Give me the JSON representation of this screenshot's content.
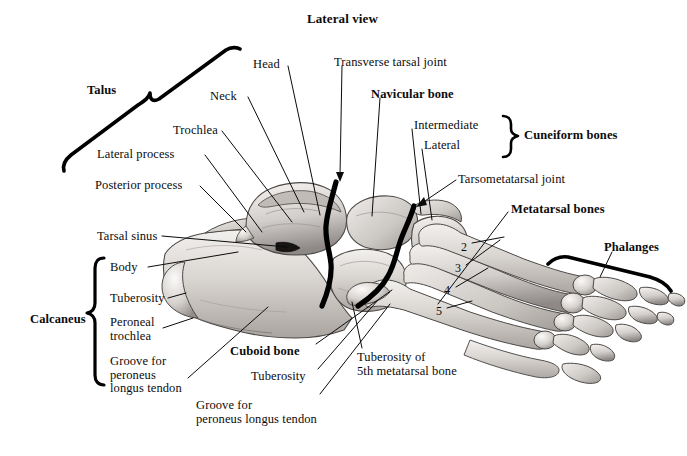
{
  "figure": {
    "title": "Lateral view",
    "background_color": "#ffffff",
    "ink_color": "#0b0b0b"
  },
  "group_labels": [
    {
      "id": "talus",
      "text": "Talus",
      "bold": true,
      "x": 87,
      "y": 84,
      "bracket": "diagonal-left"
    },
    {
      "id": "calcaneus",
      "text": "Calcaneus",
      "bold": true,
      "x": 30,
      "y": 313,
      "bracket": "vertical-left"
    },
    {
      "id": "cuneiform_bones",
      "text": "Cuneiform bones",
      "bold": true,
      "x": 524,
      "y": 132,
      "bracket": "vertical-right"
    },
    {
      "id": "metatarsal_bones",
      "text": "Metatarsal bones",
      "bold": true,
      "x": 511,
      "y": 204,
      "bracket": "none"
    },
    {
      "id": "phalanges",
      "text": "Phalanges",
      "bold": true,
      "x": 604,
      "y": 244,
      "bracket": "horizontal-bottom"
    },
    {
      "id": "navicular_bone",
      "text": "Navicular bone",
      "bold": true,
      "x": 371,
      "y": 90,
      "bracket": "none"
    },
    {
      "id": "cuboid_bone",
      "text": "Cuboid bone",
      "bold": true,
      "x": 230,
      "y": 348,
      "bracket": "none"
    }
  ],
  "part_labels": [
    {
      "id": "head",
      "text": "Head",
      "x": 253,
      "y": 59
    },
    {
      "id": "neck",
      "text": "Neck",
      "x": 210,
      "y": 92
    },
    {
      "id": "trochlea",
      "text": "Trochlea",
      "x": 173,
      "y": 127
    },
    {
      "id": "lateral_process",
      "text": "Lateral process",
      "x": 122,
      "y": 151
    },
    {
      "id": "posterior_process",
      "text": "Posterior process",
      "x": 95,
      "y": 182
    },
    {
      "id": "tarsal_sinus",
      "text": "Tarsal sinus",
      "x": 97,
      "y": 233
    },
    {
      "id": "calcaneus_body",
      "text": "Body",
      "x": 110,
      "y": 265
    },
    {
      "id": "calcaneus_tuberosity",
      "text": "Tuberosity",
      "x": 110,
      "y": 295
    },
    {
      "id": "peroneal_trochlea",
      "text": "Peroneal\ntrochlea",
      "x": 110,
      "y": 320
    },
    {
      "id": "groove_peroneus_calcaneus",
      "text": "Groove for\nperoneus\nlongus tendon",
      "x": 110,
      "y": 360
    },
    {
      "id": "transverse_tarsal_joint",
      "text": "Transverse tarsal joint",
      "x": 334,
      "y": 58
    },
    {
      "id": "cuneiform_intermediate",
      "text": "Intermediate",
      "x": 414,
      "y": 122
    },
    {
      "id": "cuneiform_lateral",
      "text": "Lateral",
      "x": 424,
      "y": 142
    },
    {
      "id": "tarsometatarsal_joint",
      "text": "Tarsometatarsal joint",
      "x": 458,
      "y": 176
    },
    {
      "id": "cuboid_tuberosity",
      "text": "Tuberosity",
      "x": 251,
      "y": 373
    },
    {
      "id": "groove_peroneus_cuboid",
      "text": "Groove for\nperoneus longus tendon",
      "x": 196,
      "y": 403
    },
    {
      "id": "tuberosity_5th_metatarsal",
      "text": "Tuberosity of\n5th metatarsal bone",
      "x": 357,
      "y": 355
    }
  ],
  "metatarsal_numbers": [
    {
      "id": "metatarsal-2",
      "text": "2",
      "x": 461,
      "y": 245
    },
    {
      "id": "metatarsal-3",
      "text": "3",
      "x": 455,
      "y": 267
    },
    {
      "id": "metatarsal-4",
      "text": "4",
      "x": 444,
      "y": 288
    },
    {
      "id": "metatarsal-5",
      "text": "5",
      "x": 436,
      "y": 310
    }
  ]
}
